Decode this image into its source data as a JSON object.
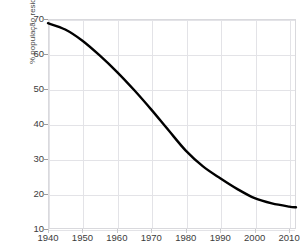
{
  "chart_data": {
    "type": "line",
    "title": "",
    "xlabel": "",
    "ylabel": "% população residente",
    "xlim": [
      1940,
      2012
    ],
    "ylim": [
      10,
      70
    ],
    "xticks": [
      1940,
      1950,
      1960,
      1970,
      1980,
      1990,
      2000,
      2010
    ],
    "xticklabels": [
      "1940",
      "1950",
      "1960",
      "1970",
      "1980",
      "1990",
      "2000",
      "2010"
    ],
    "yticks": [
      10,
      20,
      30,
      40,
      50,
      60,
      70
    ],
    "yticklabels": [
      "10",
      "20",
      "30",
      "40",
      "50",
      "60",
      "70"
    ],
    "grid": true,
    "legend": false,
    "line_color": "#000000",
    "line_width": 2.4,
    "grid_color": "#e3e3e7",
    "frame_color": "#d9d9dd",
    "x": [
      1940,
      1945,
      1950,
      1955,
      1960,
      1965,
      1970,
      1975,
      1980,
      1985,
      1990,
      1995,
      2000,
      2005,
      2010,
      2012
    ],
    "values": [
      68.8,
      67.0,
      63.8,
      59.6,
      54.9,
      49.7,
      44.1,
      38.2,
      32.4,
      27.9,
      24.5,
      21.4,
      18.8,
      17.3,
      16.4,
      16.2
    ],
    "series": [
      {
        "name": "% população residente",
        "x": [
          1940,
          1945,
          1950,
          1955,
          1960,
          1965,
          1970,
          1975,
          1980,
          1985,
          1990,
          1995,
          2000,
          2005,
          2010,
          2012
        ],
        "values": [
          68.8,
          67.0,
          63.8,
          59.6,
          54.9,
          49.7,
          44.1,
          38.2,
          32.4,
          27.9,
          24.5,
          21.4,
          18.8,
          17.3,
          16.4,
          16.2
        ]
      }
    ]
  }
}
